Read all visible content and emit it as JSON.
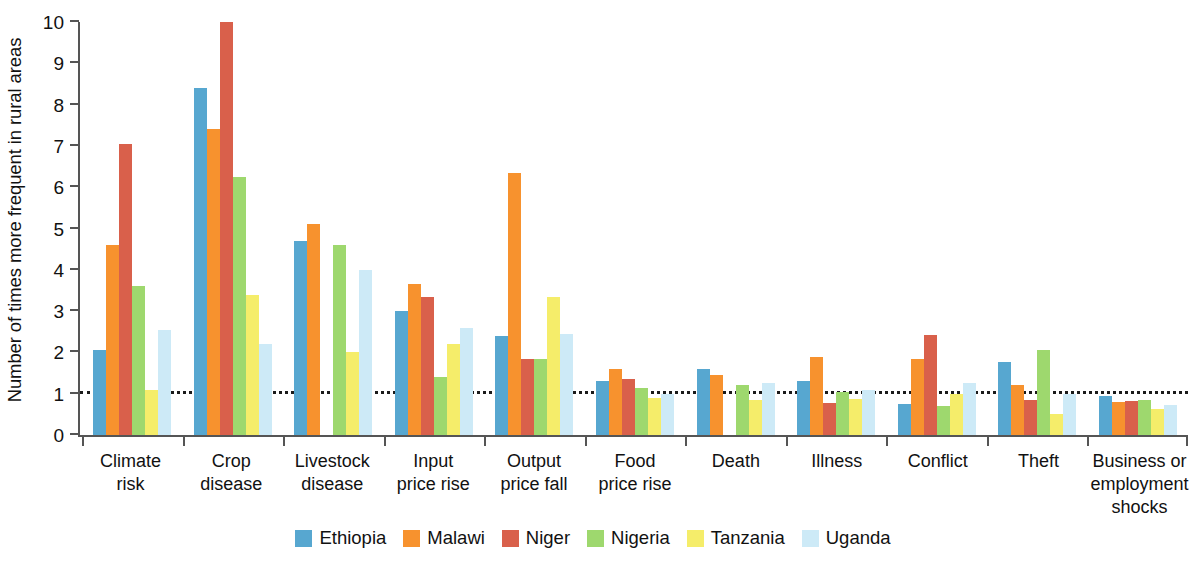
{
  "chart_data": {
    "type": "bar",
    "title": "",
    "xlabel": "",
    "ylabel": "Number of times more frequent in rural areas",
    "ylim": [
      0,
      10
    ],
    "yticks": [
      "0",
      "1",
      "2",
      "3",
      "4",
      "5",
      "6",
      "7",
      "8",
      "9",
      "10"
    ],
    "grid": false,
    "legend_position": "bottom",
    "reference_line": 1,
    "categories": [
      "Climate\nrisk",
      "Crop\ndisease",
      "Livestock\ndisease",
      "Input\nprice rise",
      "Output\nprice fall",
      "Food\nprice rise",
      "Death",
      "Illness",
      "Conflict",
      "Theft",
      "Business or\nemployment\nshocks"
    ],
    "category_lines": [
      [
        "Climate",
        "risk"
      ],
      [
        "Crop",
        "disease"
      ],
      [
        "Livestock",
        "disease"
      ],
      [
        "Input",
        "price rise"
      ],
      [
        "Output",
        "price fall"
      ],
      [
        "Food",
        "price rise"
      ],
      [
        "Death"
      ],
      [
        "Illness"
      ],
      [
        "Conflict"
      ],
      [
        "Theft"
      ],
      [
        "Business or",
        "employment",
        "shocks"
      ]
    ],
    "series": [
      {
        "name": "Ethiopia",
        "color": "#57a7d0",
        "values": [
          2.05,
          8.4,
          4.7,
          3.0,
          2.4,
          1.3,
          1.6,
          1.3,
          0.75,
          1.78,
          0.95
        ]
      },
      {
        "name": "Malawi",
        "color": "#f7922e",
        "values": [
          4.6,
          7.4,
          5.1,
          3.65,
          6.35,
          1.6,
          1.45,
          1.9,
          1.85,
          1.2,
          0.8
        ]
      },
      {
        "name": "Niger",
        "color": "#d9604b",
        "values": [
          7.05,
          10.0,
          0,
          3.35,
          1.85,
          1.35,
          0,
          0.78,
          2.42,
          0.85,
          0.82
        ]
      },
      {
        "name": "Nigeria",
        "color": "#9ed86e",
        "values": [
          3.6,
          6.25,
          4.6,
          1.4,
          1.85,
          1.15,
          1.2,
          1.05,
          0.7,
          2.05,
          0.85
        ]
      },
      {
        "name": "Tanzania",
        "color": "#f5ed6a",
        "values": [
          1.1,
          3.4,
          2.0,
          2.2,
          3.35,
          0.9,
          0.85,
          0.88,
          1.0,
          0.5,
          0.62
        ]
      },
      {
        "name": "Uganda",
        "color": "#cdeaf7",
        "values": [
          2.55,
          2.2,
          4.0,
          2.6,
          2.45,
          1.0,
          1.25,
          1.1,
          1.25,
          1.0,
          0.72
        ]
      }
    ]
  }
}
